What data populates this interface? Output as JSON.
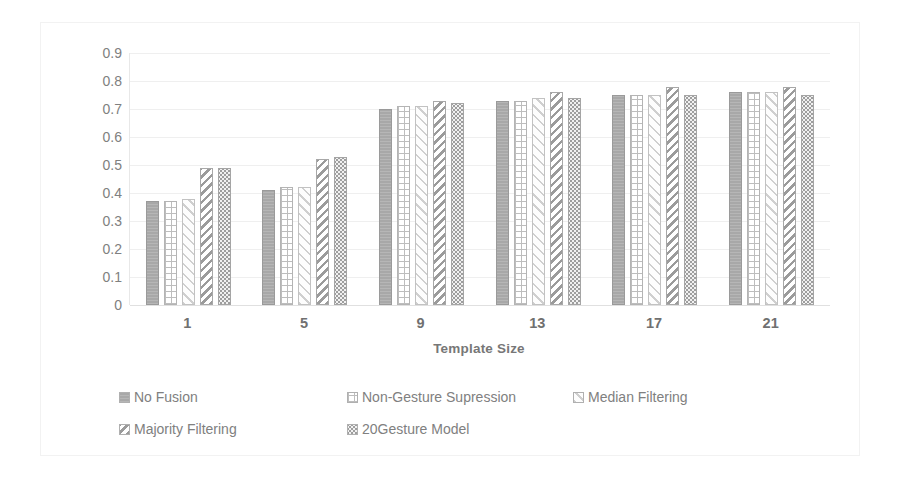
{
  "chart_data": {
    "type": "bar",
    "title": "",
    "xlabel": "Template Size",
    "ylabel": "Jaccard Index",
    "categories": [
      "1",
      "5",
      "9",
      "13",
      "17",
      "21"
    ],
    "ylim": [
      0,
      0.9
    ],
    "ytick_labels": [
      "0",
      "0.1",
      "0.2",
      "0.3",
      "0.4",
      "0.5",
      "0.6",
      "0.7",
      "0.8",
      "0.9"
    ],
    "ytick_values": [
      0,
      0.1,
      0.2,
      0.3,
      0.4,
      0.5,
      0.6,
      0.7,
      0.8,
      0.9
    ],
    "grid": true,
    "legend_position": "bottom",
    "series": [
      {
        "name": "No Fusion",
        "pattern": "solid-gray",
        "values": [
          0.37,
          0.41,
          0.7,
          0.73,
          0.75,
          0.76
        ]
      },
      {
        "name": "Non-Gesture Supression",
        "pattern": "brick",
        "values": [
          0.37,
          0.42,
          0.71,
          0.73,
          0.75,
          0.76
        ]
      },
      {
        "name": "Median Filtering",
        "pattern": "light-diagonal",
        "values": [
          0.38,
          0.42,
          0.71,
          0.74,
          0.75,
          0.76
        ]
      },
      {
        "name": "Majority Filtering",
        "pattern": "bold-diagonal",
        "values": [
          0.49,
          0.52,
          0.73,
          0.76,
          0.78,
          0.78
        ]
      },
      {
        "name": "20Gesture Model",
        "pattern": "dotted",
        "values": [
          0.49,
          0.53,
          0.72,
          0.74,
          0.75,
          0.75
        ]
      }
    ]
  },
  "legend": {
    "rows": [
      [
        "No Fusion",
        "Non-Gesture Supression",
        "Median Filtering"
      ],
      [
        "Majority Filtering",
        "20Gesture Model"
      ]
    ]
  },
  "colors": {
    "gridline": "#efefef",
    "text": "#808080",
    "bar_outline": "#b4b4b4",
    "bar_solid": "#a8a8a8"
  }
}
